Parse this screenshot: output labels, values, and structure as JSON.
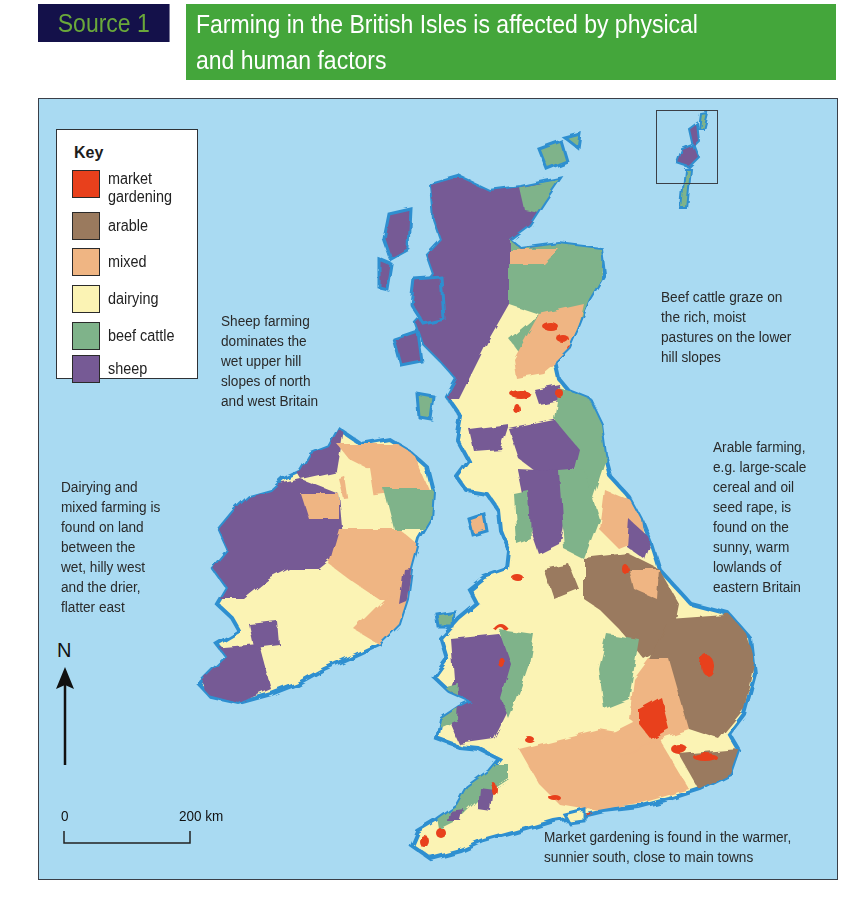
{
  "header": {
    "source_label": "Source 1",
    "title_line1": "Farming in the British Isles is affected by physical",
    "title_line2": "and human factors",
    "colors": {
      "source_bg": "#14114a",
      "source_text": "#6aa83a",
      "title_bg": "#44a63b",
      "title_text": "#ffffff"
    }
  },
  "map": {
    "colors": {
      "sea": "#a9daf2",
      "coastline": "#2e8fd0",
      "market_gardening": "#e8401c",
      "arable": "#9a7a5e",
      "mixed": "#efb583",
      "dairying": "#fbf3b4",
      "beef_cattle": "#7fb38a",
      "sheep": "#765a95"
    },
    "key": {
      "title": "Key",
      "items": [
        {
          "label_line1": "market",
          "label_line2": "gardening",
          "color": "#e8401c"
        },
        {
          "label_line1": "arable",
          "label_line2": "",
          "color": "#9a7a5e"
        },
        {
          "label_line1": "mixed",
          "label_line2": "",
          "color": "#efb583"
        },
        {
          "label_line1": "dairying",
          "label_line2": "",
          "color": "#fbf3b4"
        },
        {
          "label_line1": "beef cattle",
          "label_line2": "",
          "color": "#7fb38a"
        },
        {
          "label_line1": "sheep",
          "label_line2": "",
          "color": "#765a95"
        }
      ]
    },
    "annotations": {
      "sheep": [
        "Sheep farming",
        "dominates the",
        "wet upper hill",
        "slopes of north",
        "and west Britain"
      ],
      "beef": [
        "Beef cattle graze on",
        "the rich, moist",
        "pastures on the lower",
        "hill slopes"
      ],
      "arable": [
        "Arable farming,",
        "e.g. large-scale",
        "cereal and oil",
        "seed rape, is",
        "found on the",
        "sunny, warm",
        "lowlands of",
        "eastern Britain"
      ],
      "dairy_mixed": [
        "Dairying and",
        "mixed farming is",
        "found on land",
        "between the",
        "wet, hilly west",
        "and the drier,",
        "flatter east"
      ],
      "market": [
        "Market gardening is found in the warmer,",
        "sunnier south, close to main towns"
      ]
    },
    "north_arrow": {
      "label": "N"
    },
    "scale_bar": {
      "start": "0",
      "end": "200 km"
    },
    "inset": {
      "depicts": "Shetland Islands"
    }
  }
}
